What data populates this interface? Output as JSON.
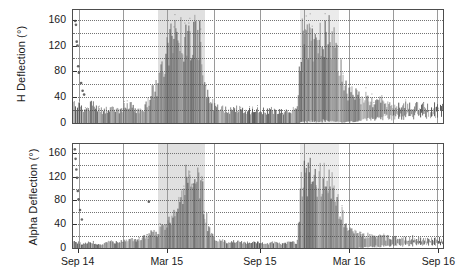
{
  "figure": {
    "panel_count": 2,
    "background": "#ffffff",
    "frame_color": "#4d4d4d",
    "grid_color": "#737373",
    "data_color": "#4a4a4a",
    "shade_color": "#d6d6d6"
  },
  "axes": {
    "y_ticks": [
      "0",
      "40",
      "80",
      "120",
      "160"
    ],
    "x_ticks": [
      "Sep 14",
      "Mar 15",
      "Sep 15",
      "Mar 16",
      "Sep 16"
    ],
    "y_title_top": "H Deflection (°)",
    "y_title_bottom": "Alpha Deflection (°)"
  },
  "chart_data": {
    "type": "line",
    "title": "",
    "xlabel": "",
    "ylabel": "Deflection (°)",
    "ylim": [
      0,
      175
    ],
    "xlim": [
      0,
      100
    ],
    "grid": true,
    "legend": "none",
    "x_tick_labels": [
      "Sep 14",
      "Mar 15",
      "Sep 15",
      "Mar 16",
      "Sep 16"
    ],
    "x_tick_positions": [
      1.5,
      25.5,
      50.5,
      74.5,
      98.5
    ],
    "y_tick_labels": [
      "0",
      "40",
      "80",
      "120",
      "160"
    ],
    "y_tick_values": [
      0,
      40,
      80,
      120,
      160
    ],
    "shaded_regions": [
      {
        "x_start": 23.0,
        "x_end": 35.8,
        "label": "event-window-1"
      },
      {
        "x_start": 61.3,
        "x_end": 72.0,
        "label": "event-window-2"
      }
    ],
    "series": [
      {
        "name": "H Deflection",
        "panel": "top",
        "ylabel": "H Deflection (°)",
        "description": "Dense high-frequency deflection record; low baseline (0-35°) through early period, escalating bursts reaching 160-170° during the first shaded window, a second sustained high-amplitude cluster in the second shaded window, then decay to a 15-45° band.",
        "envelope_max": [
          38,
          34,
          30,
          28,
          33,
          36,
          30,
          26,
          24,
          28,
          31,
          27,
          25,
          29,
          33,
          35,
          30,
          27,
          25,
          30,
          42,
          58,
          66,
          88,
          120,
          150,
          163,
          168,
          166,
          170,
          168,
          165,
          170,
          167,
          164,
          96,
          60,
          40,
          34,
          30,
          28,
          26,
          25,
          27,
          29,
          26,
          24,
          23,
          25,
          27,
          26,
          24,
          23,
          25,
          24,
          23,
          22,
          24,
          26,
          25,
          24,
          160,
          170,
          168,
          171,
          169,
          167,
          170,
          166,
          168,
          150,
          120,
          92,
          70,
          58,
          62,
          55,
          48,
          52,
          45,
          42,
          38,
          44,
          40,
          36,
          39,
          35,
          33,
          37,
          34,
          32,
          35,
          33,
          31,
          34,
          32,
          30,
          33,
          31,
          30
        ],
        "envelope_min": [
          0,
          0,
          0,
          0,
          0,
          0,
          0,
          0,
          0,
          0,
          0,
          0,
          0,
          0,
          0,
          0,
          0,
          0,
          0,
          0,
          0,
          0,
          0,
          0,
          0,
          0,
          0,
          0,
          0,
          0,
          0,
          0,
          0,
          0,
          0,
          0,
          0,
          0,
          0,
          0,
          0,
          0,
          0,
          0,
          0,
          0,
          0,
          0,
          0,
          0,
          0,
          0,
          0,
          0,
          0,
          0,
          0,
          0,
          0,
          0,
          0,
          2,
          4,
          3,
          5,
          4,
          3,
          6,
          4,
          5,
          4,
          3,
          2,
          2,
          3,
          4,
          3,
          5,
          6,
          8,
          9,
          10,
          12,
          11,
          13,
          12,
          14,
          13,
          15,
          14,
          16,
          15,
          17,
          16,
          15,
          18,
          17,
          16,
          19,
          18
        ],
        "outliers_high": [
          {
            "x": 0.6,
            "y": 158
          },
          {
            "x": 0.8,
            "y": 152
          },
          {
            "x": 1.0,
            "y": 126
          },
          {
            "x": 1.2,
            "y": 120
          },
          {
            "x": 1.4,
            "y": 88
          },
          {
            "x": 1.6,
            "y": 78
          },
          {
            "x": 2.2,
            "y": 62
          },
          {
            "x": 2.6,
            "y": 50
          },
          {
            "x": 3.0,
            "y": 44
          }
        ]
      },
      {
        "name": "Alpha Deflection",
        "panel": "bottom",
        "ylabel": "Alpha Deflection (°)",
        "description": "Low-amplitude noise (0-20°) early, progressive upward ramp through the first shaded window peaking near 150-165°, quiet interval, second high cluster (120-160°) in the second shaded window, then a long decay to a 10-30° band.",
        "envelope_max": [
          14,
          12,
          10,
          9,
          11,
          13,
          10,
          8,
          9,
          12,
          15,
          13,
          11,
          14,
          18,
          22,
          19,
          17,
          20,
          24,
          28,
          34,
          30,
          38,
          44,
          52,
          62,
          74,
          90,
          112,
          140,
          156,
          162,
          158,
          150,
          96,
          52,
          30,
          22,
          18,
          15,
          13,
          12,
          14,
          16,
          13,
          11,
          10,
          12,
          14,
          12,
          11,
          10,
          12,
          11,
          10,
          9,
          11,
          13,
          12,
          11,
          128,
          150,
          156,
          160,
          158,
          154,
          152,
          146,
          140,
          118,
          92,
          70,
          54,
          44,
          38,
          34,
          30,
          28,
          26,
          24,
          22,
          25,
          23,
          21,
          24,
          22,
          20,
          23,
          21,
          19,
          22,
          20,
          18,
          21,
          19,
          18,
          20,
          19,
          18
        ],
        "envelope_min": [
          0,
          0,
          0,
          0,
          0,
          0,
          0,
          0,
          0,
          0,
          0,
          0,
          0,
          0,
          0,
          0,
          0,
          0,
          0,
          0,
          0,
          0,
          0,
          0,
          0,
          0,
          0,
          0,
          0,
          0,
          0,
          0,
          0,
          0,
          0,
          0,
          0,
          0,
          0,
          0,
          0,
          0,
          0,
          0,
          0,
          0,
          0,
          0,
          0,
          0,
          0,
          0,
          0,
          0,
          0,
          0,
          0,
          0,
          0,
          0,
          0,
          0,
          0,
          0,
          0,
          0,
          0,
          0,
          0,
          0,
          0,
          0,
          0,
          0,
          0,
          1,
          1,
          2,
          2,
          3,
          3,
          4,
          4,
          5,
          5,
          6,
          6,
          7,
          7,
          8,
          8,
          9,
          9,
          8,
          9,
          10,
          9,
          10,
          9,
          10
        ],
        "outliers_high": [
          {
            "x": 0.5,
            "y": 166
          },
          {
            "x": 0.7,
            "y": 150
          },
          {
            "x": 0.9,
            "y": 132
          },
          {
            "x": 1.1,
            "y": 118
          },
          {
            "x": 1.3,
            "y": 96
          },
          {
            "x": 1.5,
            "y": 82
          },
          {
            "x": 1.9,
            "y": 64
          },
          {
            "x": 2.4,
            "y": 48
          },
          {
            "x": 20.5,
            "y": 78
          }
        ]
      }
    ]
  }
}
